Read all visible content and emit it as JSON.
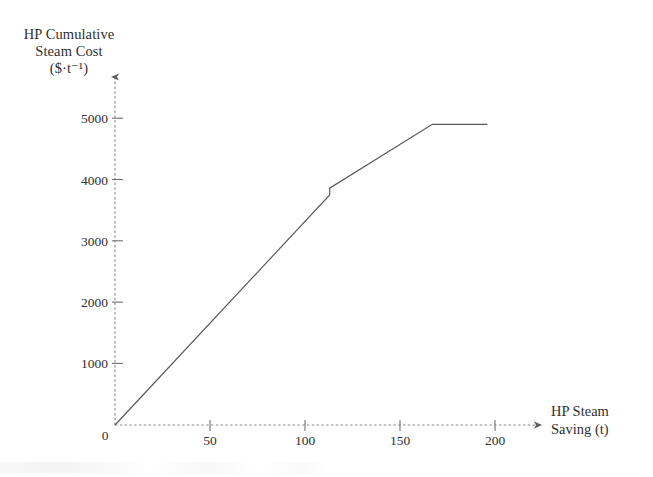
{
  "figure": {
    "background_color": "#ffffff",
    "line_color": "#5a5a5a",
    "axis_color": "#8a8a8a",
    "text_color": "#2f2f2f"
  },
  "axes": {
    "y_axis_label_lines": [
      "HP Cumulative",
      "Steam Cost",
      "($·t⁻¹)"
    ],
    "x_axis_label_lines": [
      "HP Steam",
      "Saving (t)"
    ],
    "origin_label": "0",
    "y_tick_labels": [
      "1000",
      "2000",
      "3000",
      "4000",
      "5000"
    ],
    "x_tick_labels": [
      "50",
      "100",
      "150",
      "200"
    ]
  },
  "chart_data": {
    "type": "line",
    "title": "",
    "subtitle": "",
    "xlabel": "HP Steam Saving (t)",
    "ylabel": "HP Cumulative Steam Cost ($·t⁻¹)",
    "xlim": [
      0,
      210
    ],
    "ylim": [
      0,
      5200
    ],
    "xticks": [
      0,
      50,
      100,
      150,
      200
    ],
    "yticks": [
      0,
      1000,
      2000,
      3000,
      4000,
      5000
    ],
    "grid": false,
    "legend": null,
    "legend_position": "none",
    "axis_style": "dashed-with-arrowheads",
    "series": [
      {
        "name": "HP cumulative steam cost",
        "style": "solid",
        "color": "#5a5a5a",
        "x": [
          0,
          113,
          113,
          167,
          196
        ],
        "y": [
          0,
          3750,
          3860,
          4900,
          4900
        ]
      }
    ],
    "annotations": [
      {
        "text": "small vertical step (cost discontinuity)",
        "x": 113,
        "y": 3800
      },
      {
        "text": "plateau - cumulative cost saturates",
        "x": 182,
        "y": 4900
      }
    ]
  }
}
